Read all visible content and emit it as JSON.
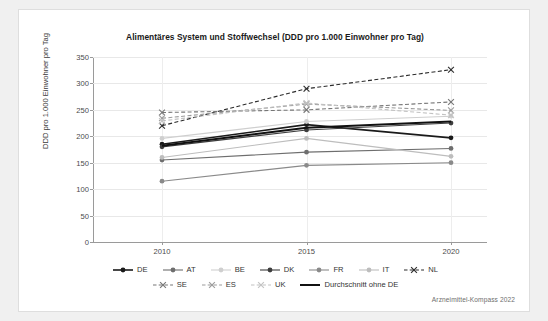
{
  "figure": {
    "credit": "Arzneimittel-Kompass 2022"
  },
  "chart_data": {
    "type": "line",
    "title": "Alimentäres System und Stoffwechsel (DDD pro 1.000 Einwohner pro Tag)",
    "xlabel": "",
    "ylabel": "DDD pro 1.000 Einwohner pro Tag",
    "x": [
      "2010",
      "2015",
      "2020"
    ],
    "categories": [
      "2010",
      "2015",
      "2020"
    ],
    "ylim": [
      0,
      350
    ],
    "yticks": [
      "0",
      "50",
      "100",
      "150",
      "200",
      "250",
      "300",
      "350"
    ],
    "grid": true,
    "legend_position": "bottom",
    "series": [
      {
        "name": "DE",
        "values": [
          185,
          222,
          197
        ],
        "color": "#1a1a1a",
        "style": "solid",
        "marker": "circle",
        "width": 1.6
      },
      {
        "name": "AT",
        "values": [
          155,
          170,
          177
        ],
        "color": "#6e6e6e",
        "style": "solid",
        "marker": "circle",
        "width": 1.1
      },
      {
        "name": "BE",
        "values": [
          196,
          228,
          238
        ],
        "color": "#cfcfcf",
        "style": "solid",
        "marker": "circle",
        "width": 1.1
      },
      {
        "name": "DK",
        "values": [
          180,
          212,
          225
        ],
        "color": "#3d3d3d",
        "style": "solid",
        "marker": "circle",
        "width": 1.1
      },
      {
        "name": "FR",
        "values": [
          115,
          145,
          150
        ],
        "color": "#8a8a8a",
        "style": "solid",
        "marker": "circle",
        "width": 1.1
      },
      {
        "name": "IT",
        "values": [
          160,
          196,
          162
        ],
        "color": "#bdbdbd",
        "style": "solid",
        "marker": "circle",
        "width": 1.1
      },
      {
        "name": "NL",
        "values": [
          220,
          290,
          326
        ],
        "color": "#2b2b2b",
        "style": "dashed",
        "marker": "cross",
        "width": 1.1
      },
      {
        "name": "SE",
        "values": [
          245,
          250,
          265
        ],
        "color": "#767676",
        "style": "dashed",
        "marker": "cross",
        "width": 1.1
      },
      {
        "name": "ES",
        "values": [
          234,
          261,
          249
        ],
        "color": "#9b9b9b",
        "style": "dashed",
        "marker": "cross",
        "width": 1.1
      },
      {
        "name": "UK",
        "values": [
          229,
          263,
          240
        ],
        "color": "#c2c2c2",
        "style": "dashed",
        "marker": "cross",
        "width": 1.1
      },
      {
        "name": "Durchschnitt ohne DE",
        "values": [
          182,
          216,
          228
        ],
        "color": "#111111",
        "style": "solid",
        "marker": "none",
        "width": 2.0
      }
    ]
  },
  "legend": {
    "rows": [
      [
        "DE",
        "AT",
        "BE",
        "DK",
        "FR",
        "IT",
        "NL"
      ],
      [
        "SE",
        "ES",
        "UK",
        "Durchschnitt ohne DE"
      ]
    ]
  }
}
